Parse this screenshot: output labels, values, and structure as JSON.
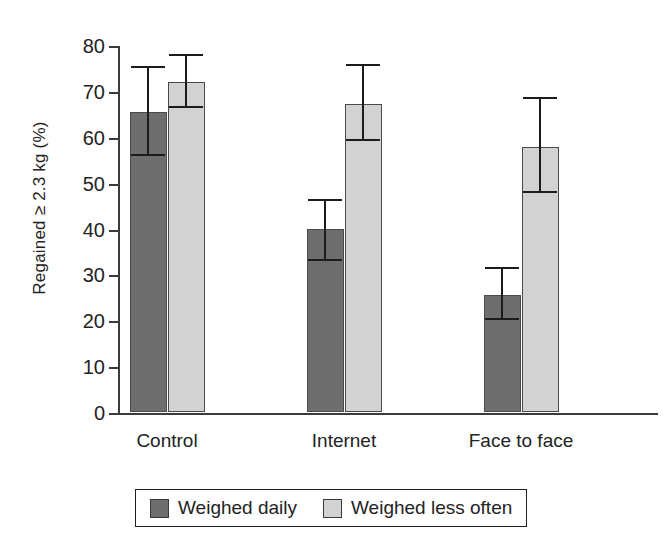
{
  "chart_data": {
    "type": "bar",
    "title": "",
    "xlabel": "",
    "ylabel": "Regained ≥ 2.3 kg (%)",
    "categories": [
      "Control",
      "Internet",
      "Face to face"
    ],
    "ylim": [
      0,
      80
    ],
    "yticks": [
      0,
      10,
      20,
      30,
      40,
      50,
      60,
      70,
      80
    ],
    "ytick_labels": [
      "0",
      "10",
      "20",
      "30",
      "40",
      "50",
      "60",
      "70",
      "80"
    ],
    "grid": false,
    "legend_position": "bottom",
    "error_bars": "95% CI",
    "series": [
      {
        "name": "Weighed daily",
        "color": "#6e6e6e",
        "values": [
          65.4,
          39.8,
          25.4
        ],
        "err_low": [
          55.8,
          33.0,
          20.0
        ],
        "err_high": [
          75.0,
          46.0,
          31.2
        ]
      },
      {
        "name": "Weighed less often",
        "color": "#d2d2d2",
        "values": [
          72.0,
          67.2,
          57.8
        ],
        "err_low": [
          66.3,
          59.0,
          47.8
        ],
        "err_high": [
          77.5,
          75.5,
          68.2
        ]
      }
    ]
  },
  "legend": {
    "items": [
      {
        "label": "Weighed daily",
        "color": "#6e6e6e"
      },
      {
        "label": "Weighed less often",
        "color": "#d2d2d2"
      }
    ]
  }
}
